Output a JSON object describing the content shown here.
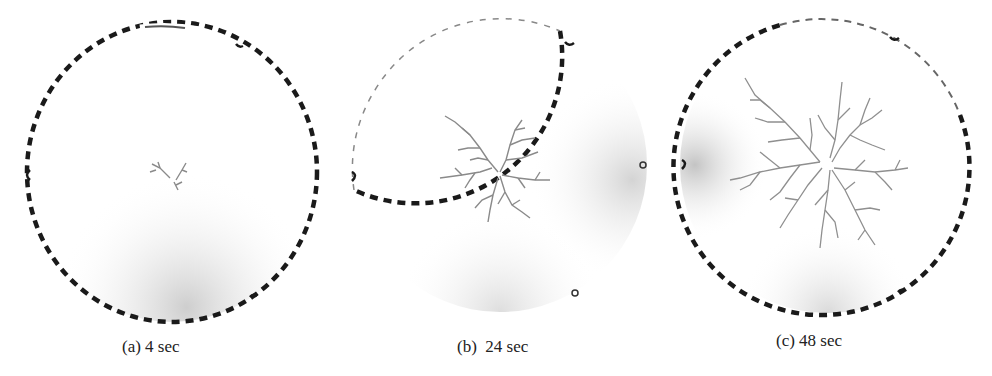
{
  "figure": {
    "panels": [
      {
        "id": "a",
        "caption": "(a) 4 sec",
        "time_sec": 4,
        "growth": "small"
      },
      {
        "id": "b",
        "caption": "(b)  24 sec",
        "time_sec": 24,
        "growth": "medium"
      },
      {
        "id": "c",
        "caption": "(c) 48 sec",
        "time_sec": 48,
        "growth": "large"
      }
    ],
    "colors": {
      "boundary": "#1a1a1a",
      "dendrite": "#8a8a8a",
      "shading": "#bdbdbd",
      "background": "#ffffff"
    }
  }
}
